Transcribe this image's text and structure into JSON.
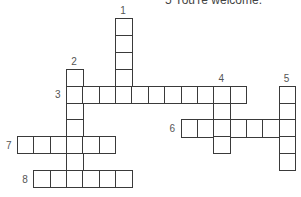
{
  "clues_visible": {
    "text": "5  You're welcome."
  },
  "grid": {
    "cell_width": 16.35,
    "cell_height": 16.9,
    "origin_x": 17,
    "origin_y": 18,
    "line_color": "#3a3a3a"
  },
  "words": [
    {
      "number": "1",
      "direction": "down",
      "col": 6,
      "row": 0,
      "length": 5
    },
    {
      "number": "2",
      "direction": "down",
      "col": 3,
      "row": 3,
      "length": 7
    },
    {
      "number": "3",
      "direction": "across",
      "col": 3,
      "row": 4,
      "length": 11
    },
    {
      "number": "4",
      "direction": "down",
      "col": 12,
      "row": 4,
      "length": 4
    },
    {
      "number": "5",
      "direction": "down",
      "col": 16,
      "row": 4,
      "length": 5
    },
    {
      "number": "6",
      "direction": "across",
      "col": 10,
      "row": 6,
      "length": 7
    },
    {
      "number": "7",
      "direction": "across",
      "col": 0,
      "row": 7,
      "length": 6
    },
    {
      "number": "8",
      "direction": "across",
      "col": 1,
      "row": 9,
      "length": 6
    }
  ]
}
